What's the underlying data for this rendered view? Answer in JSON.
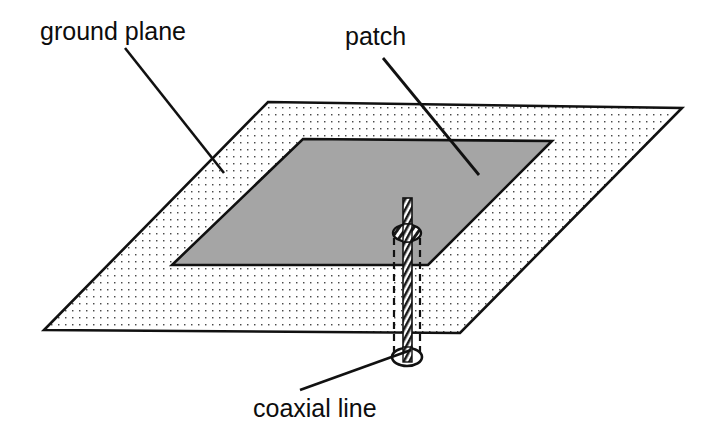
{
  "figure": {
    "background_color": "#ffffff",
    "width": 713,
    "height": 433
  },
  "labels": {
    "ground_plane": "ground plane",
    "patch": "patch",
    "coaxial_line": "coaxial line"
  },
  "colors": {
    "outline": "#111111",
    "patch_fill": "#a5a5a5",
    "ground_plane_fill": "#ffffff",
    "ground_plane_dot": "#4a4a4a",
    "conductor_hatch": "#1a1a1a",
    "background": "#ffffff"
  },
  "parts": {
    "ground_plane": {
      "name": "ground plane",
      "shape": "parallelogram",
      "fill": "dotted stipple",
      "points": "268,102 682,108 460,333 44,330"
    },
    "patch": {
      "name": "patch",
      "shape": "parallelogram",
      "fill": "solid gray",
      "points": "303,139 552,141 428,265 172,265"
    },
    "coaxial_line": {
      "name": "coaxial line",
      "shape": "cylinder with inner conductor",
      "outer_left_x": 394,
      "outer_right_x": 420,
      "top_y": 232,
      "bottom_y": 357,
      "inner_conductor_top_y": 198,
      "inner_conductor_bottom_y": 362
    }
  },
  "leaders": {
    "ground_plane": {
      "x1": 125,
      "y1": 48,
      "x2": 224,
      "y2": 173
    },
    "patch": {
      "x1": 383,
      "y1": 58,
      "x2": 479,
      "y2": 175
    },
    "coaxial_line": {
      "x1": 300,
      "y1": 390,
      "x2": 411,
      "y2": 350
    }
  },
  "label_positions": {
    "ground_plane": {
      "x": 40,
      "y": 40
    },
    "patch": {
      "x": 345,
      "y": 45
    },
    "coaxial_line": {
      "x": 253,
      "y": 417
    }
  }
}
